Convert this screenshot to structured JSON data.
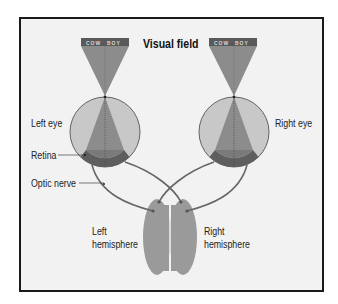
{
  "title": "Visual field",
  "visual_field_word": {
    "left_half": "COW",
    "right_half": "BOY"
  },
  "labels": {
    "left_eye": "Left eye",
    "right_eye": "Right eye",
    "retina": "Retina",
    "optic_nerve": "Optic nerve",
    "left_hemisphere_line1": "Left",
    "left_hemisphere_line2": "hemisphere",
    "right_hemisphere_line1": "Right",
    "right_hemisphere_line2": "hemisphere"
  },
  "colors": {
    "background": "#f2f2f2",
    "frame": "#1a1a1a",
    "word_bar": "#5a5a5a",
    "cone": "#8c8c8c",
    "eye_fill": "#c8c8c8",
    "retina": "#5e5e5e",
    "nerve": "#666666",
    "brain": "#9a9a9a"
  }
}
